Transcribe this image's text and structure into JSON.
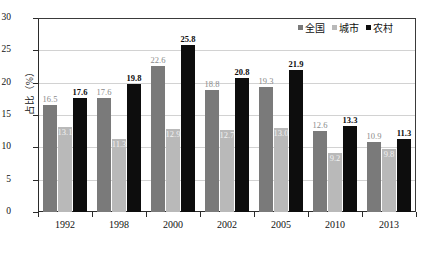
{
  "chart_data": {
    "type": "bar",
    "title": "",
    "xlabel": "",
    "ylabel": "占比（%）",
    "ylim": [
      0,
      30
    ],
    "ytick_step": 5,
    "yticks": [
      "30",
      "25",
      "20",
      "15",
      "10",
      "5",
      "0"
    ],
    "grid": true,
    "legend_position": "top-right",
    "categories": [
      "1992",
      "1998",
      "2000",
      "2002",
      "2005",
      "2010",
      "2013"
    ],
    "series": [
      {
        "name": "全国",
        "color": "#7a7a7a",
        "values": [
          16.5,
          17.6,
          22.6,
          18.8,
          19.3,
          12.6,
          10.9
        ],
        "labels": [
          "16.5",
          "17.6",
          "22.6",
          "18.8",
          "19.3",
          "12.6",
          "10.9"
        ]
      },
      {
        "name": "城市",
        "color": "#b9b9b9",
        "values": [
          13.1,
          11.3,
          12.9,
          12.7,
          13.0,
          9.2,
          9.8
        ],
        "labels": [
          "13.1",
          "11.3",
          "12.9",
          "12.7",
          "13.0",
          "9.2",
          "9.8"
        ]
      },
      {
        "name": "农村",
        "color": "#0d0d0d",
        "values": [
          17.6,
          19.8,
          25.8,
          20.8,
          21.9,
          13.3,
          11.3
        ],
        "labels": [
          "17.6",
          "19.8",
          "25.8",
          "20.8",
          "21.9",
          "13.3",
          "11.3"
        ]
      }
    ]
  },
  "legend": {
    "items": [
      {
        "label": "全国"
      },
      {
        "label": "城市"
      },
      {
        "label": "农村"
      }
    ]
  },
  "axis": {
    "y_title": "占比（%）"
  }
}
